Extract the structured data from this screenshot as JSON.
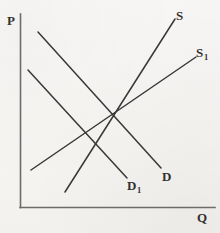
{
  "figure": {
    "kind": "supply-demand-diagram",
    "background_color": "#f7f6f3",
    "line_color": "#3a3837",
    "axis_color": "#6e6c6b",
    "width": 220,
    "height": 233
  },
  "axes": {
    "price_axis_label": "P",
    "quantity_axis_label": "Q",
    "vertical": {
      "x": 20,
      "y_top": 14,
      "y_bottom": 207
    },
    "horizontal": {
      "y": 207,
      "x_left": 20,
      "x_right": 215
    }
  },
  "curves": [
    {
      "id": "supply",
      "label": "S",
      "label_sub": "",
      "direction": "upward",
      "x1": 65,
      "y1": 192,
      "x2": 175,
      "y2": 19
    },
    {
      "id": "supply-shifted",
      "label": "S",
      "label_sub": "1",
      "direction": "upward",
      "x1": 31,
      "y1": 170,
      "x2": 196,
      "y2": 57
    },
    {
      "id": "demand",
      "label": "D",
      "label_sub": "",
      "direction": "downward",
      "x1": 38,
      "y1": 32,
      "x2": 161,
      "y2": 168
    },
    {
      "id": "demand-shifted",
      "label": "D",
      "label_sub": "1",
      "direction": "downward",
      "x1": 28,
      "y1": 70,
      "x2": 127,
      "y2": 178
    }
  ],
  "chart_data": {
    "type": "line",
    "title": "",
    "xlabel": "Q",
    "ylabel": "P",
    "grid": false,
    "legend": "inline-end-labels",
    "series": [
      {
        "name": "S",
        "x": [
          65,
          175
        ],
        "y_pixel": [
          192,
          19
        ],
        "slope": "positive"
      },
      {
        "name": "S1",
        "x": [
          31,
          196
        ],
        "y_pixel": [
          170,
          57
        ],
        "slope": "positive"
      },
      {
        "name": "D",
        "x": [
          38,
          161
        ],
        "y_pixel": [
          32,
          168
        ],
        "slope": "negative"
      },
      {
        "name": "D1",
        "x": [
          28,
          127
        ],
        "y_pixel": [
          70,
          178
        ],
        "slope": "negative"
      }
    ]
  },
  "labels": {
    "P": "P",
    "Q": "Q",
    "S": "S",
    "S1_base": "S",
    "S1_sub": "1",
    "D": "D",
    "D1_base": "D",
    "D1_sub": "1"
  }
}
